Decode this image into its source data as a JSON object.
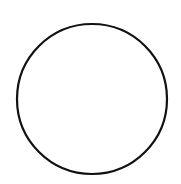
{
  "canvas": {
    "width": 181,
    "height": 184,
    "background": "#ffffff"
  },
  "shapes": [
    {
      "type": "circle",
      "cx": 92,
      "cy": 99,
      "r": 75,
      "stroke": "#111111",
      "stroke_width": 2.2,
      "fill": "none"
    }
  ]
}
